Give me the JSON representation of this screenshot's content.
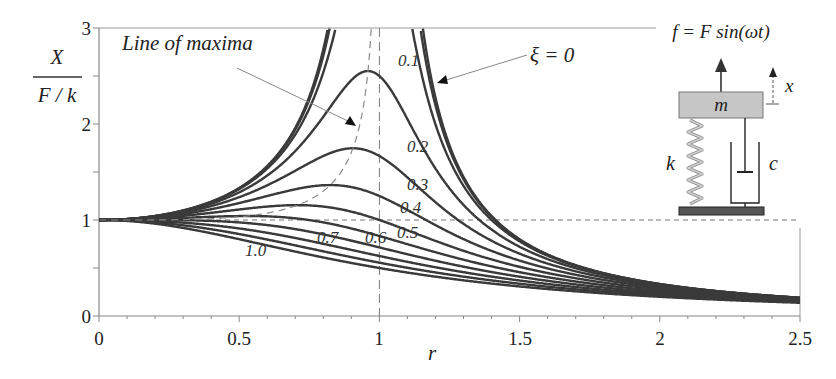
{
  "chart_data": {
    "type": "line",
    "title": "",
    "xlabel": "r",
    "ylabel": "X / (F/k)",
    "ylabel_numerator": "X",
    "ylabel_denominator": "F / k",
    "xlim": [
      0,
      2.5
    ],
    "ylim": [
      0,
      3
    ],
    "x_ticks": [
      "0",
      "0.5",
      "1",
      "1.5",
      "2",
      "2.5"
    ],
    "y_ticks": [
      "0",
      "1",
      "2",
      "3"
    ],
    "grid": false,
    "formula": "X/(F/k) = 1 / sqrt((1 - r^2)^2 + (2 xi r)^2)",
    "series": [
      {
        "name": "ξ = 0",
        "xi": 0.0,
        "label": "ξ = 0"
      },
      {
        "name": "ξ = 0.05",
        "xi": 0.05,
        "label": ""
      },
      {
        "name": "ξ = 0.1",
        "xi": 0.1,
        "label": "0.1"
      },
      {
        "name": "ξ = 0.2",
        "xi": 0.2,
        "label": "0.2",
        "peak": {
          "r": 0.96,
          "value": 2.55
        }
      },
      {
        "name": "ξ = 0.3",
        "xi": 0.3,
        "label": "0.3",
        "peak": {
          "r": 0.91,
          "value": 1.75
        }
      },
      {
        "name": "ξ = 0.4",
        "xi": 0.4,
        "label": "0.4",
        "peak": {
          "r": 0.82,
          "value": 1.36
        }
      },
      {
        "name": "ξ = 0.5",
        "xi": 0.5,
        "label": "0.5",
        "peak": {
          "r": 0.71,
          "value": 1.15
        }
      },
      {
        "name": "ξ = 0.6",
        "xi": 0.6,
        "label": "0.6",
        "peak": {
          "r": 0.53,
          "value": 1.04
        }
      },
      {
        "name": "ξ = 0.7",
        "xi": 0.7,
        "label": "0.7"
      },
      {
        "name": "ξ = 0.8",
        "xi": 0.8,
        "label": ""
      },
      {
        "name": "ξ = 0.9",
        "xi": 0.9,
        "label": ""
      },
      {
        "name": "ξ = 1.0",
        "xi": 1.0,
        "label": "1.0"
      }
    ],
    "reference_lines": [
      {
        "type": "horizontal",
        "y": 1,
        "style": "dashed"
      },
      {
        "type": "vertical",
        "x": 1,
        "style": "dashed"
      },
      {
        "type": "curve",
        "name": "Line of maxima",
        "style": "dashed"
      }
    ],
    "annotations": [
      {
        "text": "Line of maxima",
        "arrow_to": {
          "r": 0.95,
          "y": 2.0
        }
      },
      {
        "text": "ξ = 0",
        "arrow_to": {
          "r": 1.14,
          "y": 2.2
        }
      }
    ]
  },
  "inset": {
    "force_label": "f = F sin(ωt)",
    "displacement_label": "x",
    "mass_label": "m",
    "spring_label": "k",
    "damper_label": "c"
  },
  "labels": {
    "xi_zero": "ξ = 0",
    "line_of_maxima": "Line of maxima"
  }
}
